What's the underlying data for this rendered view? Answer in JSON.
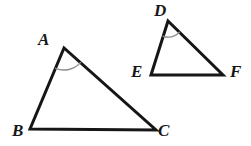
{
  "figure": {
    "name": "two-similar-triangles",
    "background_color": "#ffffff",
    "stroke_color": "#161616",
    "arc_color": "#8c8c8c",
    "stroke_width": 3,
    "arc_width": 1.4,
    "canvas": {
      "width": 251,
      "height": 146
    }
  },
  "triangles": [
    {
      "id": "triangle-abc",
      "name": "triangle-abc",
      "vertices": [
        {
          "label": "A",
          "x": 64,
          "y": 48,
          "label_x": 38,
          "label_y": 31
        },
        {
          "label": "B",
          "x": 30,
          "y": 129,
          "label_x": 12,
          "label_y": 122
        },
        {
          "label": "C",
          "x": 156,
          "y": 130,
          "label_x": 158,
          "label_y": 122
        }
      ],
      "angle_mark": {
        "at": "A",
        "name": "angle-arc-a",
        "radius": 22,
        "start_angle_deg": 67,
        "end_angle_deg": 23
      }
    },
    {
      "id": "triangle-def",
      "name": "triangle-def",
      "vertices": [
        {
          "label": "D",
          "x": 168,
          "y": 21,
          "label_x": 154,
          "label_y": 2
        },
        {
          "label": "E",
          "x": 151,
          "y": 75,
          "label_x": 131,
          "label_y": 63
        },
        {
          "label": "F",
          "x": 223,
          "y": 75,
          "label_x": 230,
          "label_y": 63
        }
      ],
      "angle_mark": {
        "at": "D",
        "name": "angle-arc-d",
        "radius": 16,
        "start_angle_deg": 72,
        "end_angle_deg": 37
      }
    }
  ],
  "labels": {
    "a": "A",
    "b": "B",
    "c": "C",
    "d": "D",
    "e": "E",
    "f": "F"
  }
}
